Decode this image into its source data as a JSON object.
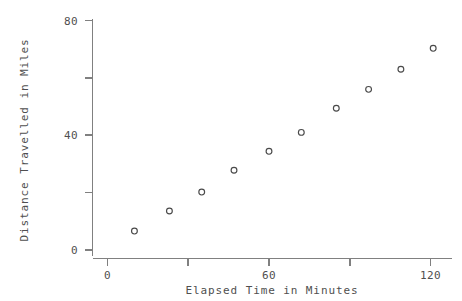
{
  "chart_data": {
    "type": "scatter",
    "title": "",
    "xlabel": "Elapsed Time in Minutes",
    "ylabel": "Distance Travelled in Miles",
    "xlim": [
      -4,
      128
    ],
    "ylim": [
      -2,
      82
    ],
    "grid": false,
    "legend": null,
    "marker": "open-circle",
    "x_ticks": [
      {
        "value": 0,
        "label": "0"
      },
      {
        "value": 30,
        "label": ""
      },
      {
        "value": 60,
        "label": "60"
      },
      {
        "value": 90,
        "label": ""
      },
      {
        "value": 120,
        "label": "120"
      }
    ],
    "y_ticks": [
      {
        "value": 0,
        "label": "0"
      },
      {
        "value": 20,
        "label": ""
      },
      {
        "value": 40,
        "label": "40"
      },
      {
        "value": 60,
        "label": ""
      },
      {
        "value": 80,
        "label": "80"
      }
    ],
    "x": [
      10,
      23,
      35,
      47,
      60,
      72,
      85,
      97,
      109,
      121
    ],
    "y": [
      6.6,
      13.6,
      20.2,
      27.8,
      34.4,
      41.0,
      49.4,
      56.0,
      63.0,
      70.3
    ],
    "points": [
      {
        "x": 10,
        "y": 6.6
      },
      {
        "x": 23,
        "y": 13.6
      },
      {
        "x": 35,
        "y": 20.2
      },
      {
        "x": 47,
        "y": 27.8
      },
      {
        "x": 60,
        "y": 34.4
      },
      {
        "x": 72,
        "y": 41.0
      },
      {
        "x": 85,
        "y": 49.4
      },
      {
        "x": 97,
        "y": 56.0
      },
      {
        "x": 109,
        "y": 63.0
      },
      {
        "x": 121,
        "y": 70.3
      }
    ]
  },
  "labels": {
    "x_axis_title": "Elapsed Time in Minutes",
    "y_axis_title": "Distance Travelled in Miles",
    "x_tick_0": "0",
    "x_tick_60": "60",
    "x_tick_120": "120",
    "y_tick_0": "0",
    "y_tick_40": "40",
    "y_tick_80": "80"
  },
  "colors": {
    "axis": "#808080",
    "marker": "#4a4a4a",
    "text": "#4f4f4f",
    "background": "#ffffff"
  }
}
